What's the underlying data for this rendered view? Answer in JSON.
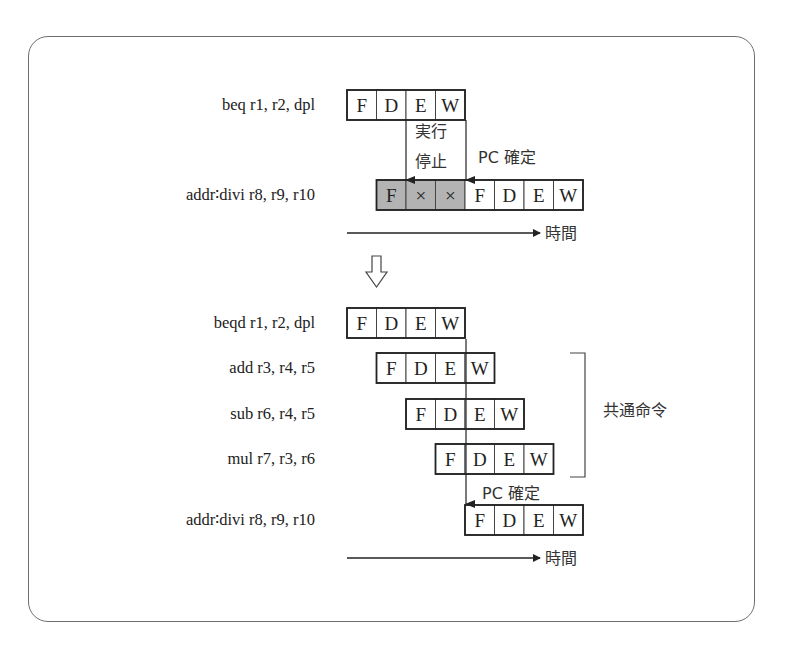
{
  "colors": {
    "stall_fill": "#b3b3b3",
    "cell_fill": "#ffffff",
    "line": "#222222",
    "frame": "#6e6e6e"
  },
  "top": {
    "instructions": [
      {
        "label": "beq r1,  r2,  dpl",
        "start_slot": 0,
        "stages": [
          {
            "text": "F",
            "stall": false
          },
          {
            "text": "D",
            "stall": false
          },
          {
            "text": "E",
            "stall": false
          },
          {
            "text": "W",
            "stall": false
          }
        ]
      },
      {
        "label": "addr∶divi r8,  r9,  r10",
        "start_slot": 1,
        "stages": [
          {
            "text": "F",
            "stall": true
          },
          {
            "text": "×",
            "stall": true
          },
          {
            "text": "×",
            "stall": true
          },
          {
            "text": "F",
            "stall": false
          },
          {
            "text": "D",
            "stall": false
          },
          {
            "text": "E",
            "stall": false
          },
          {
            "text": "W",
            "stall": false
          }
        ]
      }
    ],
    "stop_label_line1": "実行",
    "stop_label_line2": "停止",
    "pc_label": "PC 確定",
    "time_label": "時間"
  },
  "transition_arrow": "hollow-down-arrow-icon",
  "bottom": {
    "instructions": [
      {
        "label": "beqd r1,  r2,  dpl",
        "start_slot": 0,
        "stages": [
          "F",
          "D",
          "E",
          "W"
        ]
      },
      {
        "label": "add r3,  r4,  r5",
        "start_slot": 1,
        "stages": [
          "F",
          "D",
          "E",
          "W"
        ]
      },
      {
        "label": "sub r6,  r4,  r5",
        "start_slot": 2,
        "stages": [
          "F",
          "D",
          "E",
          "W"
        ]
      },
      {
        "label": "mul r7,  r3,  r6",
        "start_slot": 3,
        "stages": [
          "F",
          "D",
          "E",
          "W"
        ]
      },
      {
        "label": "addr∶divi r8,  r9,  r10",
        "start_slot": 4,
        "stages": [
          "F",
          "D",
          "E",
          "W"
        ]
      }
    ],
    "common_label": "共通命令",
    "pc_label": "PC 確定",
    "time_label": "時間"
  }
}
